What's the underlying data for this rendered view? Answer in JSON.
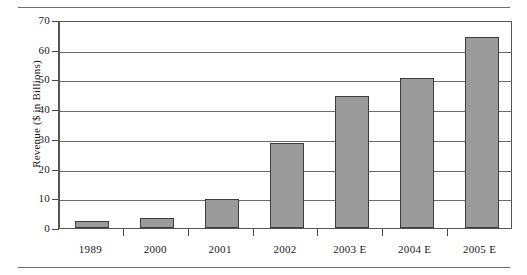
{
  "chart_data": {
    "type": "bar",
    "title": "",
    "subtitle": "",
    "xlabel": "",
    "ylabel": "Revenue ($ in Billions)",
    "categories": [
      "1989",
      "2000",
      "2001",
      "2002",
      "2003  E",
      "2004  E",
      "2005  E"
    ],
    "values": [
      2.5,
      3.5,
      9.8,
      28.7,
      44.4,
      50.5,
      64.3
    ],
    "ylim": [
      0,
      70
    ],
    "ytick_labels": [
      "0",
      "10",
      "20",
      "30",
      "40",
      "50",
      "60",
      "70"
    ],
    "ytick_values": [
      0,
      10,
      20,
      30,
      40,
      50,
      60,
      70
    ],
    "grid": "horizontal",
    "legend": "none",
    "bar_color": "#9b9b9b",
    "bar_edge_color": "#3d3d3d",
    "axis_color": "#555555",
    "gridline_color": "#6b6b6b"
  }
}
